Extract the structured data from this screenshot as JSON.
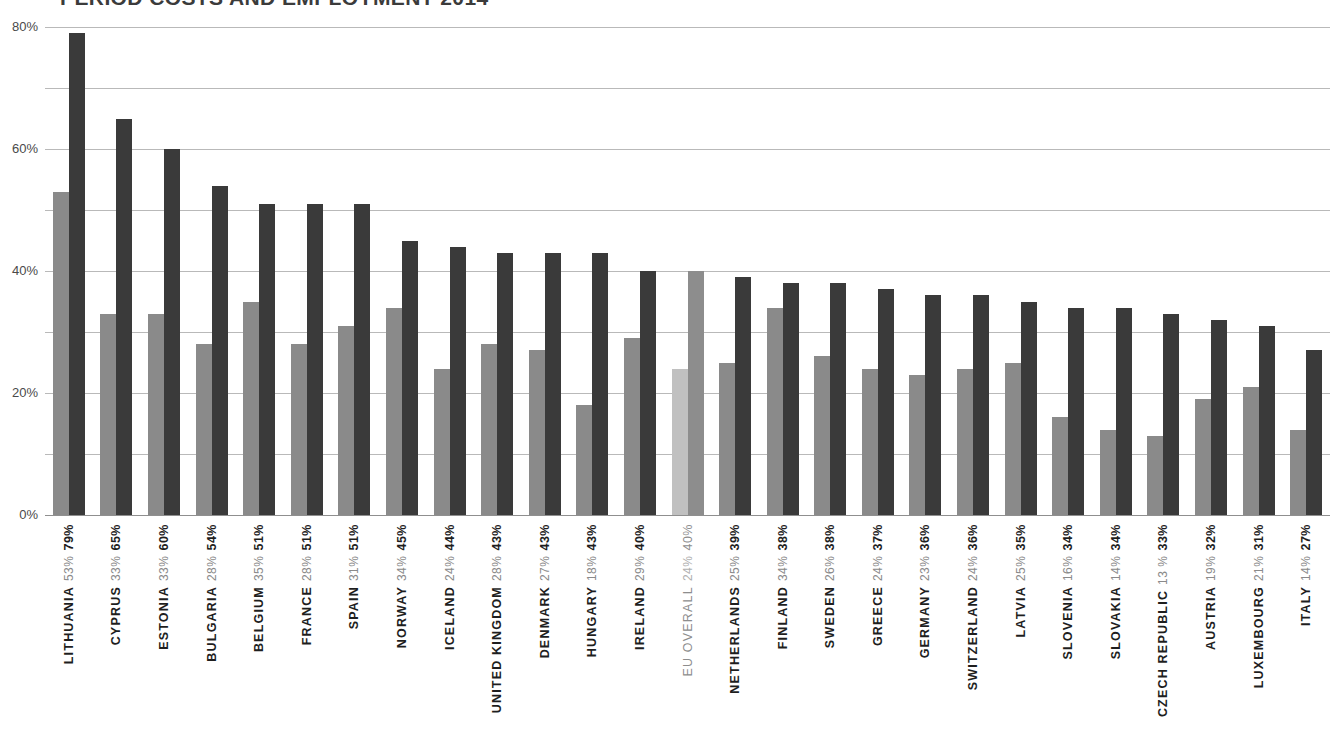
{
  "chart_data": {
    "type": "bar",
    "title": "PERIOD COSTS AND EMPLOYMENT 2014",
    "subtitle": "",
    "xlabel": "",
    "ylabel": "",
    "ylim": [
      0,
      80
    ],
    "ytick_labels": [
      "0%",
      "20%",
      "40%",
      "60%",
      "80%"
    ],
    "ytick_values": [
      0,
      20,
      40,
      60,
      80
    ],
    "gridline_values": [
      0,
      10,
      20,
      30,
      40,
      50,
      60,
      70,
      80
    ],
    "grid": true,
    "legend": "none",
    "value_suffix": "%",
    "categories": [
      "LITHUANIA",
      "CYPRUS",
      "ESTONIA",
      "BULGARIA",
      "BELGIUM",
      "FRANCE",
      "SPAIN",
      "NORWAY",
      "ICELAND",
      "UNITED KINGDOM",
      "DENMARK",
      "HUNGARY",
      "IRELAND",
      "EU OVERALL",
      "NETHERLANDS",
      "FINLAND",
      "SWEDEN",
      "GREECE",
      "GERMANY",
      "SWITZERLAND",
      "LATVIA",
      "SLOVENIA",
      "SLOVAKIA",
      "CZECH REPUBLIC",
      "AUSTRIA",
      "LUXEMBOURG",
      "ITALY"
    ],
    "highlight_category": "EU OVERALL",
    "series": [
      {
        "name": "series-1",
        "color": "#8a8a8a",
        "highlight_color": "#c0c0c0",
        "values": [
          53,
          33,
          33,
          28,
          35,
          28,
          31,
          34,
          24,
          28,
          27,
          18,
          29,
          24,
          25,
          34,
          26,
          24,
          23,
          24,
          25,
          16,
          14,
          13,
          19,
          21,
          14
        ]
      },
      {
        "name": "series-2",
        "color": "#3a3a3a",
        "highlight_color": "#8d8d8d",
        "values": [
          79,
          65,
          60,
          54,
          51,
          51,
          51,
          45,
          44,
          43,
          43,
          43,
          40,
          40,
          39,
          38,
          38,
          37,
          36,
          36,
          35,
          34,
          34,
          33,
          32,
          31,
          27
        ]
      }
    ],
    "labels": [
      {
        "category": "LITHUANIA",
        "v1": "53%",
        "v2": "79%"
      },
      {
        "category": "CYPRUS",
        "v1": "33%",
        "v2": "65%"
      },
      {
        "category": "ESTONIA",
        "v1": "33%",
        "v2": "60%"
      },
      {
        "category": "BULGARIA",
        "v1": "28%",
        "v2": "54%"
      },
      {
        "category": "BELGIUM",
        "v1": "35%",
        "v2": "51%"
      },
      {
        "category": "FRANCE",
        "v1": "28%",
        "v2": "51%"
      },
      {
        "category": "SPAIN",
        "v1": "31%",
        "v2": "51%"
      },
      {
        "category": "NORWAY",
        "v1": "34%",
        "v2": "45%"
      },
      {
        "category": "ICELAND",
        "v1": "24%",
        "v2": "44%"
      },
      {
        "category": "UNITED KINGDOM",
        "v1": "28%",
        "v2": "43%"
      },
      {
        "category": "DENMARK",
        "v1": "27%",
        "v2": "43%"
      },
      {
        "category": "HUNGARY",
        "v1": "18%",
        "v2": "43%"
      },
      {
        "category": "IRELAND",
        "v1": "29%",
        "v2": "40%"
      },
      {
        "category": "EU OVERALL",
        "v1": "24%",
        "v2": "40%"
      },
      {
        "category": "NETHERLANDS",
        "v1": "25%",
        "v2": "39%"
      },
      {
        "category": "FINLAND",
        "v1": "34%",
        "v2": "38%"
      },
      {
        "category": "SWEDEN",
        "v1": "26%",
        "v2": "38%"
      },
      {
        "category": "GREECE",
        "v1": "24%",
        "v2": "37%"
      },
      {
        "category": "GERMANY",
        "v1": "23%",
        "v2": "36%"
      },
      {
        "category": "SWITZERLAND",
        "v1": "24%",
        "v2": "36%"
      },
      {
        "category": "LATVIA",
        "v1": "25%",
        "v2": "35%"
      },
      {
        "category": "SLOVENIA",
        "v1": "16%",
        "v2": "34%"
      },
      {
        "category": "SLOVAKIA",
        "v1": "14%",
        "v2": "34%"
      },
      {
        "category": "CZECH REPUBLIC",
        "v1": "13 %",
        "v2": "33%"
      },
      {
        "category": "AUSTRIA",
        "v1": "19%",
        "v2": "32%"
      },
      {
        "category": "LUXEMBOURG",
        "v1": "21%",
        "v2": "31%"
      },
      {
        "category": "ITALY",
        "v1": "14%",
        "v2": "27%"
      }
    ]
  }
}
